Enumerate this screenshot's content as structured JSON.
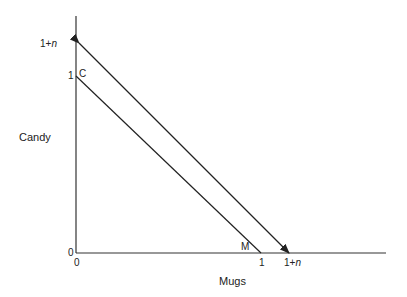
{
  "diagram": {
    "type": "budget-constraint",
    "y_axis": {
      "title": "Candy",
      "ticks": [
        {
          "label": "0"
        },
        {
          "label": "1"
        },
        {
          "label_prefix": "1+",
          "label_var": "n"
        }
      ]
    },
    "x_axis": {
      "title": "Mugs",
      "ticks": [
        {
          "label": "0"
        },
        {
          "label": "1"
        },
        {
          "label_prefix": "1+",
          "label_var": "n"
        }
      ]
    },
    "lines": [
      {
        "name": "original",
        "from": {
          "x": 0,
          "y": 1
        },
        "to": {
          "x": 1,
          "y": 0
        },
        "endpoint_labels": {
          "start": "C",
          "end": "M"
        }
      },
      {
        "name": "rotated",
        "from": {
          "x": 0,
          "y": "1+n"
        },
        "to": {
          "x": "1+n",
          "y": 0
        },
        "arrows": "both"
      }
    ],
    "colors": {
      "line": "#222222",
      "background": "#ffffff"
    }
  }
}
